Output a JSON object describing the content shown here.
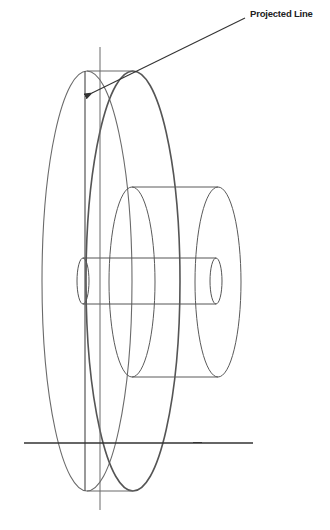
{
  "diagram": {
    "annotation": "Projected Line",
    "colors": {
      "stroke": "#5a5a5a",
      "dark_stroke": "#333333",
      "background": "#ffffff"
    },
    "components": [
      "large-disc",
      "hub-cylinder",
      "shaft",
      "vertical-axis",
      "projected-line",
      "ground-line",
      "annotation-arrow"
    ]
  }
}
